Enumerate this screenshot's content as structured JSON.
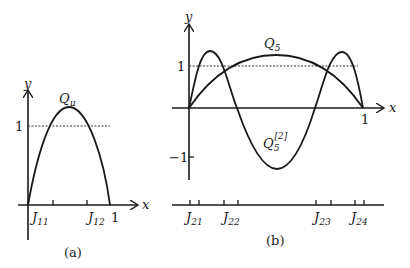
{
  "panels": [
    {
      "id": "a",
      "caption": "(a)",
      "axis_labels": {
        "x": "x",
        "y": "y"
      },
      "y_tick_label": "1",
      "x_end_label": "1",
      "curve_label": {
        "main": "Q",
        "sub": "μ"
      },
      "interval_labels": [
        {
          "main": "J",
          "sub": "11"
        },
        {
          "main": "J",
          "sub": "12"
        }
      ]
    },
    {
      "id": "b",
      "caption": "(b)",
      "axis_labels": {
        "x": "x",
        "y": "y"
      },
      "y_tick_labels": {
        "one": "1",
        "minus_one": "−1"
      },
      "x_end_label": "1",
      "curve_labels": [
        {
          "main": "Q",
          "sub": "5",
          "sup": ""
        },
        {
          "main": "Q",
          "sub": "5",
          "sup": "[2]"
        }
      ],
      "interval_labels": [
        {
          "main": "J",
          "sub": "21"
        },
        {
          "main": "J",
          "sub": "22"
        },
        {
          "main": "J",
          "sub": "23"
        },
        {
          "main": "J",
          "sub": "24"
        }
      ]
    }
  ]
}
